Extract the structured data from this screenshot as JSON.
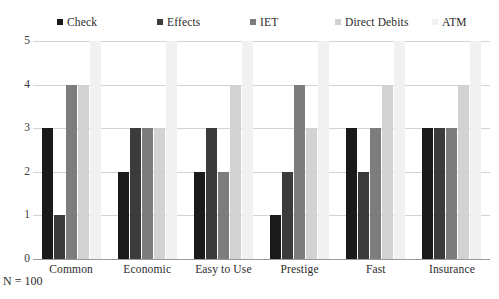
{
  "chart_data": {
    "type": "bar",
    "title": "",
    "xlabel": "",
    "ylabel": "",
    "ylim": [
      0,
      5
    ],
    "yticks": [
      0,
      1,
      2,
      3,
      4,
      5
    ],
    "grid": true,
    "legend_position": "top",
    "categories": [
      "Common",
      "Economic",
      "Easy to Use",
      "Prestige",
      "Fast",
      "Insurance"
    ],
    "series": [
      {
        "name": "Check",
        "color": "#1a1a1a",
        "values": [
          3,
          2,
          2,
          1,
          3,
          3
        ]
      },
      {
        "name": "Effects",
        "color": "#3b3b3b",
        "values": [
          1,
          3,
          3,
          2,
          2,
          3
        ]
      },
      {
        "name": "IET",
        "color": "#7d7d7d",
        "values": [
          4,
          3,
          2,
          4,
          3,
          3
        ]
      },
      {
        "name": "Direct Debits",
        "color": "#d2d2d2",
        "values": [
          4,
          3,
          4,
          3,
          4,
          4
        ]
      },
      {
        "name": "ATM",
        "color": "#f1f1f1",
        "values": [
          5,
          5,
          5,
          5,
          5,
          5
        ]
      }
    ]
  },
  "title_sliver": "",
  "footnote": "N = 100"
}
